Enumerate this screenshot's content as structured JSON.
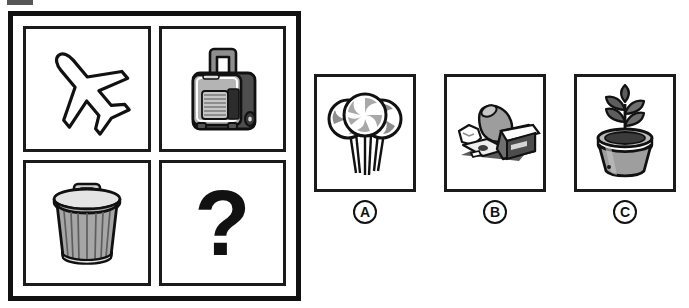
{
  "puzzle": {
    "type": "visual-analogy-matrix",
    "matrix": {
      "rows": 2,
      "columns": 2,
      "cells": [
        {
          "position": "top-left",
          "icon": "airplane-icon",
          "label": "airplane"
        },
        {
          "position": "top-right",
          "icon": "suitcase-icon",
          "label": "rolling suitcase"
        },
        {
          "position": "bottom-left",
          "icon": "trash-can-icon",
          "label": "trash can"
        },
        {
          "position": "bottom-right",
          "icon": "question-mark",
          "label": "?"
        }
      ]
    },
    "options": [
      {
        "letter": "A",
        "icon": "lollipops-icon",
        "label": "lollipops"
      },
      {
        "letter": "B",
        "icon": "litter-icon",
        "label": "litter"
      },
      {
        "letter": "C",
        "icon": "potted-plant-icon",
        "label": "potted plant"
      }
    ]
  },
  "colors": {
    "outline": "#111111",
    "cell_border": "#1b1b1b",
    "background": "#ffffff",
    "gray_mid": "#9a9a9a",
    "gray_dark": "#6b6b6b",
    "gray_light": "#c9c9c9"
  }
}
